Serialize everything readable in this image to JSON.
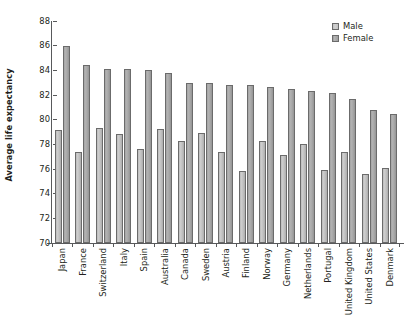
{
  "chart_data": {
    "type": "bar",
    "title": "",
    "subtitle": "",
    "xlabel": "",
    "ylabel": "Average life expectancy",
    "ylim": [
      70,
      88
    ],
    "ytick_step": 2,
    "yticks": [
      88,
      86,
      84,
      82,
      80,
      78,
      76,
      74,
      72,
      70
    ],
    "ytick_labels": [
      "88",
      "86",
      "84",
      "82",
      "80",
      "78",
      "76",
      "74",
      "72",
      "70"
    ],
    "grid": false,
    "legend_position": "top-right",
    "categories": [
      "Japan",
      "France",
      "Switzerland",
      "Italy",
      "Spain",
      "Australia",
      "Canada",
      "Sweden",
      "Austria",
      "Finland",
      "Norway",
      "Germany",
      "Netherlands",
      "Portugal",
      "United Kingdom",
      "United States",
      "Denmark"
    ],
    "series": [
      {
        "name": "Male",
        "color": "#c6c6c6",
        "values": [
          79.2,
          77.4,
          79.3,
          78.8,
          77.6,
          79.25,
          78.3,
          78.9,
          77.35,
          75.85,
          78.25,
          77.1,
          78.0,
          75.9,
          77.4,
          75.6,
          76.1
        ]
      },
      {
        "name": "Female",
        "color": "#a8a8a8",
        "values": [
          86.0,
          84.4,
          84.1,
          84.1,
          84.05,
          83.75,
          82.95,
          82.95,
          82.85,
          82.85,
          82.65,
          82.45,
          82.3,
          82.15,
          81.7,
          80.75,
          80.5
        ]
      }
    ],
    "legend": [
      {
        "label": "Male",
        "swatch": "male-swatch"
      },
      {
        "label": "Female",
        "swatch": "female-swatch"
      }
    ]
  },
  "axis": {
    "y_title": "Average life expectancy"
  }
}
